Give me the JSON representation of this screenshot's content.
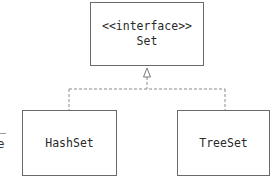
{
  "diagram": {
    "type": "uml-class-diagram",
    "interface": {
      "stereotype": "<<interface>>",
      "name": "Set"
    },
    "classes": [
      {
        "name": "HashSet"
      },
      {
        "name": "TreeSet"
      }
    ],
    "relationships": [
      {
        "from": "HashSet",
        "to": "Set",
        "kind": "realization"
      },
      {
        "from": "TreeSet",
        "to": "Set",
        "kind": "realization"
      }
    ],
    "left_fragment": {
      "text": "e"
    }
  }
}
